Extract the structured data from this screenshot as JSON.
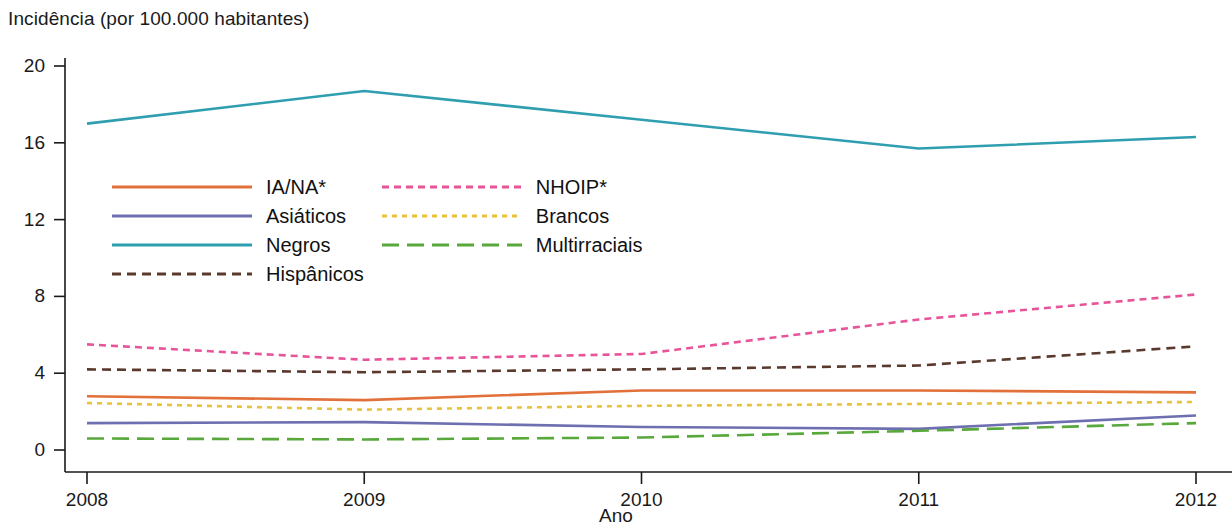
{
  "chart_data": {
    "type": "line",
    "title": "",
    "ylabel": "Incidência (por 100.000 habitantes)",
    "xlabel": "Ano",
    "categories": [
      "2008",
      "2009",
      "2010",
      "2011",
      "2012"
    ],
    "x": [
      2008,
      2009,
      2010,
      2011,
      2012
    ],
    "xlim": [
      2008,
      2012
    ],
    "ylim": [
      0,
      20
    ],
    "yticks": [
      0,
      4,
      8,
      12,
      16,
      20
    ],
    "ytick_labels": [
      "0",
      "4",
      "8",
      "12",
      "16",
      "20"
    ],
    "xtick_labels": [
      "2008",
      "2009",
      "2010",
      "2011",
      "2012"
    ],
    "grid": false,
    "legend_position": "inside-upper-left",
    "series": [
      {
        "name": "IA/NA*",
        "color": "#E2703A",
        "style": "solid",
        "dasharray": "",
        "values": [
          2.8,
          2.6,
          3.1,
          3.1,
          3.0
        ]
      },
      {
        "name": "Asiáticos",
        "color": "#6E6FB0",
        "style": "solid",
        "dasharray": "",
        "values": [
          1.4,
          1.45,
          1.2,
          1.1,
          1.8
        ]
      },
      {
        "name": "Negros",
        "color": "#2F9FB0",
        "style": "solid",
        "dasharray": "",
        "values": [
          17.0,
          18.7,
          17.2,
          15.7,
          16.3
        ]
      },
      {
        "name": "Hispânicos",
        "color": "#5B3A2E",
        "style": "dashed",
        "dasharray": "9 6",
        "values": [
          4.2,
          4.05,
          4.2,
          4.4,
          5.4
        ]
      },
      {
        "name": "NHOIP*",
        "color": "#E8549A",
        "style": "dotted-dashed",
        "dasharray": "7 5",
        "values": [
          5.5,
          4.7,
          5.0,
          6.8,
          8.1
        ]
      },
      {
        "name": "Brancos",
        "color": "#E8C23C",
        "style": "dotted",
        "dasharray": "5 5",
        "values": [
          2.45,
          2.1,
          2.3,
          2.4,
          2.5
        ]
      },
      {
        "name": "Multirraciais",
        "color": "#58A83C",
        "style": "long-dashed",
        "dasharray": "17 8",
        "values": [
          0.6,
          0.55,
          0.65,
          1.0,
          1.4
        ]
      }
    ],
    "legend": {
      "column_left": [
        "IA/NA*",
        "Asiáticos",
        "Negros",
        "Hispânicos"
      ],
      "column_right": [
        "NHOIP*",
        "Brancos",
        "Multirraciais"
      ]
    }
  }
}
